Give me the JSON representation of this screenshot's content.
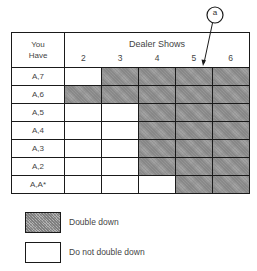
{
  "annotation": {
    "label": "a"
  },
  "table": {
    "row_header": [
      "You",
      "Have"
    ],
    "col_header": "Dealer Shows",
    "dealer_cards": [
      "2",
      "3",
      "4",
      "5",
      "6"
    ],
    "rows": [
      {
        "hand": "A,7",
        "cells": [
          false,
          true,
          true,
          true,
          true
        ]
      },
      {
        "hand": "A,6",
        "cells": [
          true,
          true,
          true,
          true,
          true
        ]
      },
      {
        "hand": "A,5",
        "cells": [
          false,
          false,
          true,
          true,
          true
        ]
      },
      {
        "hand": "A,4",
        "cells": [
          false,
          false,
          true,
          true,
          true
        ]
      },
      {
        "hand": "A,3",
        "cells": [
          false,
          false,
          true,
          true,
          true
        ]
      },
      {
        "hand": "A,2",
        "cells": [
          false,
          false,
          true,
          true,
          true
        ]
      },
      {
        "hand": "A,A*",
        "cells": [
          false,
          false,
          false,
          true,
          true
        ]
      }
    ]
  },
  "legend": {
    "shaded_label": "Double down",
    "blank_label": "Do not double down"
  }
}
